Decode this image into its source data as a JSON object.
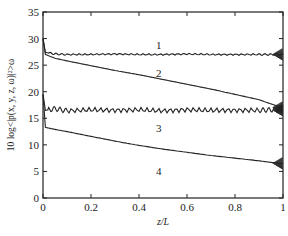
{
  "chart_data": {
    "type": "line",
    "title": "",
    "xlabel": "z/L",
    "ylabel": "10 log<|p(x, y, z, ω)|²>ω",
    "xlim": [
      0,
      1
    ],
    "ylim": [
      0,
      35
    ],
    "xticks": [
      "0",
      "0.2",
      "0.4",
      "0.6",
      "0.8",
      "1"
    ],
    "yticks": [
      "0",
      "5",
      "10",
      "15",
      "20",
      "25",
      "30",
      "35"
    ],
    "grid": false,
    "legend": "inline curve labels 1-4",
    "x": [
      0.0,
      0.01,
      0.05,
      0.1,
      0.2,
      0.3,
      0.4,
      0.5,
      0.6,
      0.7,
      0.8,
      0.9,
      0.95,
      1.0
    ],
    "series": [
      {
        "name": "1",
        "values": [
          30.0,
          27.4,
          27.1,
          27.0,
          27.0,
          27.1,
          27.0,
          27.0,
          27.1,
          27.0,
          27.0,
          27.0,
          27.0,
          27.0
        ]
      },
      {
        "name": "2",
        "values": [
          30.0,
          27.0,
          26.3,
          25.8,
          24.9,
          24.0,
          23.2,
          22.3,
          21.4,
          20.5,
          19.5,
          18.5,
          17.7,
          17.0
        ]
      },
      {
        "name": "3",
        "values": [
          19.5,
          16.5,
          16.8,
          16.4,
          16.6,
          16.5,
          16.6,
          16.4,
          16.6,
          16.5,
          16.5,
          16.5,
          16.6,
          16.5
        ]
      },
      {
        "name": "4",
        "values": [
          19.5,
          13.3,
          12.9,
          12.5,
          11.6,
          10.7,
          9.9,
          9.2,
          8.6,
          8.0,
          7.5,
          7.0,
          6.7,
          6.5
        ]
      }
    ],
    "annotations": [
      {
        "text": "1",
        "x": 0.48,
        "y": 29.3
      },
      {
        "text": "2",
        "x": 0.48,
        "y": 23.5
      },
      {
        "text": "3",
        "x": 0.48,
        "y": 13.0
      },
      {
        "text": "4",
        "x": 0.48,
        "y": 4.9
      }
    ]
  },
  "labels": {
    "xlabel": "z/L",
    "ylabel": "10 log<|p(x, y, z, ω)|²>ω",
    "curve1": "1",
    "curve2": "2",
    "curve3": "3",
    "curve4": "4"
  },
  "colors": {
    "line": "#222222",
    "axis": "#222222",
    "background": "#ffffff"
  }
}
